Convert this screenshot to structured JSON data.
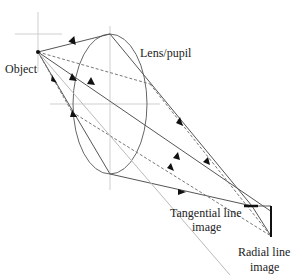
{
  "diagram": {
    "labels": {
      "object": "Object",
      "lens": "Lens/pupil",
      "tangential_line1": "Tangential line",
      "tangential_line2": "image",
      "radial_line1": "Radial line",
      "radial_line2": "image"
    },
    "colors": {
      "ray": "#555555",
      "dashed_ray": "#777777",
      "guide": "#c8c8c8",
      "text": "#222222"
    }
  }
}
